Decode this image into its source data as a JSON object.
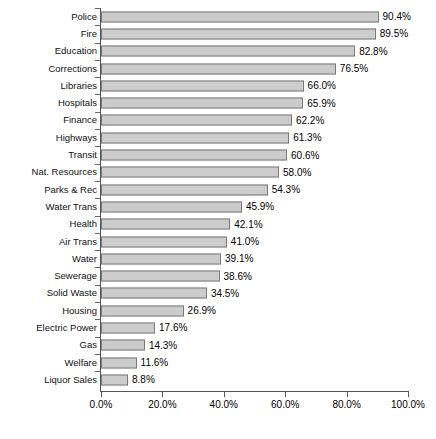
{
  "chart_data": {
    "type": "bar",
    "orientation": "horizontal",
    "title": "",
    "subtitle": "",
    "xlabel": "",
    "ylabel": "",
    "xlim": [
      0,
      100
    ],
    "grid": false,
    "legend": null,
    "value_suffix": "%",
    "xticks": [
      "0.0%",
      "20.0%",
      "40.0%",
      "60.0%",
      "80.0%",
      "100.0%"
    ],
    "xtick_values": [
      0,
      20,
      40,
      60,
      80,
      100
    ],
    "categories": [
      "Police",
      "Fire",
      "Education",
      "Corrections",
      "Libraries",
      "Hospitals",
      "Finance",
      "Highways",
      "Transit",
      "Nat. Resources",
      "Parks & Rec",
      "Water Trans",
      "Health",
      "Air Trans",
      "Water",
      "Sewerage",
      "Solid Waste",
      "Housing",
      "Electric Power",
      "Gas",
      "Welfare",
      "Liquor Sales"
    ],
    "values": [
      90.4,
      89.5,
      82.8,
      76.5,
      66.0,
      65.9,
      62.2,
      61.3,
      60.6,
      58.0,
      54.3,
      45.9,
      42.1,
      41.0,
      39.1,
      38.6,
      34.5,
      26.9,
      17.6,
      14.3,
      11.6,
      8.8
    ],
    "data_labels": [
      "90.4%",
      "89.5%",
      "82.8%",
      "76.5%",
      "66.0%",
      "65.9%",
      "62.2%",
      "61.3%",
      "60.6%",
      "58.0%",
      "54.3%",
      "45.9%",
      "42.1%",
      "41.0%",
      "39.1%",
      "38.6%",
      "34.5%",
      "26.9%",
      "17.6%",
      "14.3%",
      "11.6%",
      "8.8%"
    ],
    "colors": {
      "bar_fill": "#cccccc",
      "bar_border": "#7a7a7a",
      "axis": "#555555",
      "text": "#000000",
      "background": "#ffffff"
    }
  }
}
